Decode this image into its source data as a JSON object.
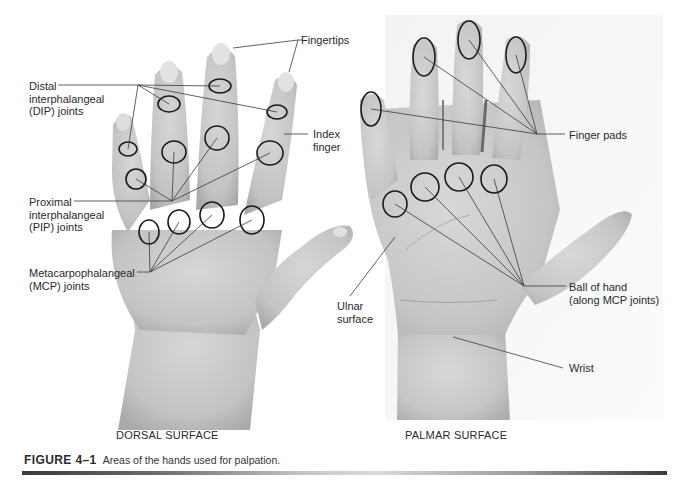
{
  "figure": {
    "number": "FIGURE 4–1",
    "caption": "Areas of the hands used for palpation.",
    "accent_color": "#2b2b2b"
  },
  "dorsal": {
    "title": "DORSAL SURFACE",
    "labels": {
      "fingertips": "Fingertips",
      "dip": "Distal\ninterphalangeal\n(DIP) joints",
      "index": "Index\nfinger",
      "pip": "Proximal\ninterphalangeal\n(PIP) joints",
      "mcp": "Metacarpophalangeal\n(MCP) joints"
    }
  },
  "palmar": {
    "title": "PALMAR SURFACE",
    "labels": {
      "finger_pads": "Finger pads",
      "ball": "Ball of hand\n(along MCP joints)",
      "ulnar": "Ulnar\nsurface",
      "wrist": "Wrist"
    }
  }
}
